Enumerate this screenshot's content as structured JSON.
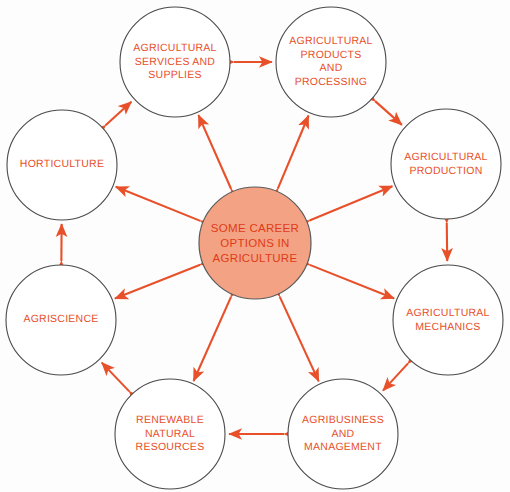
{
  "canvas": {
    "width": 510,
    "height": 492,
    "background": "#fdfdfd"
  },
  "colors": {
    "arrow": "#e8502a",
    "node_outline": "#4a4a4a",
    "node_fill": "#ffffff",
    "center_fill": "#f3a383",
    "center_outline": "#5a5a5a",
    "node_text": "#e8502a",
    "center_text": "#e03b18"
  },
  "center": {
    "name": "some-career-options-in-agriculture",
    "label": "SOME CAREER\nOPTIONS IN\nAGRICULTURE",
    "cx": 255,
    "cy": 243,
    "r": 56
  },
  "nodes": [
    {
      "name": "agricultural-services-and-supplies",
      "label": "AGRICULTURAL\nSERVICES AND\nSUPPLIES",
      "cx": 175,
      "cy": 62,
      "r": 55,
      "angle": -114
    },
    {
      "name": "agricultural-products-and-processing",
      "label": "AGRICULTURAL\nPRODUCTS\nAND\nPROCESSING",
      "cx": 331,
      "cy": 62,
      "r": 55,
      "angle": -66
    },
    {
      "name": "agricultural-production",
      "label": "AGRICULTURAL\nPRODUCTION",
      "cx": 446,
      "cy": 164,
      "r": 55,
      "angle": -21
    },
    {
      "name": "agricultural-mechanics",
      "label": "AGRICULTURAL\nMECHANICS",
      "cx": 448,
      "cy": 320,
      "r": 55,
      "angle": 21
    },
    {
      "name": "agribusiness-and-management",
      "label": "AGRIBUSINESS\nAND\nMANAGEMENT",
      "cx": 343,
      "cy": 434,
      "r": 55,
      "angle": 66
    },
    {
      "name": "renewable-natural-resources",
      "label": "RENEWABLE\nNATURAL\nRESOURCES",
      "cx": 170,
      "cy": 434,
      "r": 55,
      "angle": 114
    },
    {
      "name": "agriscience",
      "label": "AGRISCIENCE",
      "cx": 61,
      "cy": 320,
      "r": 55,
      "angle": 159
    },
    {
      "name": "horticulture",
      "label": "HORTICULTURE",
      "cx": 62,
      "cy": 165,
      "r": 55,
      "angle": -159
    }
  ],
  "connections": {
    "spokes_description": "double-headed arrows from center circle to each of the eight outer circles",
    "ring_description": "double-headed arrows between each pair of adjacent outer circles",
    "spoke_count": 8,
    "ring_count": 8
  }
}
